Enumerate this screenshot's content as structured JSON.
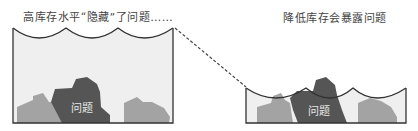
{
  "diagram": {
    "left_panel": {
      "caption": "高库存水平“隐藏”了问题……",
      "rock_label": "问题",
      "state": "high inventory water level covering rocks"
    },
    "right_panel": {
      "caption": "降低库存会暴露问题",
      "rock_label": "问题",
      "state": "lowered water level exposing rocks"
    },
    "connector": "dashed line from left water level to right water level",
    "colors": {
      "water": "#efefef",
      "rock_light": "#a3a3a3",
      "rock_dark": "#555555",
      "outline": "#333333",
      "text": "#444444"
    }
  }
}
